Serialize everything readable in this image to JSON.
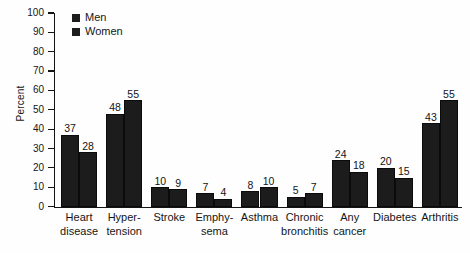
{
  "chart_data": {
    "type": "bar",
    "title": "",
    "xlabel": "",
    "ylabel": "Percent",
    "ylim": [
      0,
      100
    ],
    "ytick_step": 10,
    "yticks": [
      100,
      90,
      80,
      70,
      60,
      50,
      40,
      30,
      20,
      10,
      0
    ],
    "grid": false,
    "legend_position": "top-left",
    "categories": [
      "Heart disease",
      "Hypertension",
      "Stroke",
      "Emphysema",
      "Asthma",
      "Chronic bronchitis",
      "Any cancer",
      "Diabetes",
      "Arthritis"
    ],
    "category_label_lines": [
      [
        "Heart",
        "disease"
      ],
      [
        "Hyper-",
        "tension"
      ],
      [
        "Stroke",
        ""
      ],
      [
        "Emphy-",
        "sema"
      ],
      [
        "Asthma",
        ""
      ],
      [
        "Chronic",
        "bronchitis"
      ],
      [
        "Any",
        "cancer"
      ],
      [
        "Diabetes",
        ""
      ],
      [
        "Arthritis",
        ""
      ]
    ],
    "series": [
      {
        "name": "Men",
        "values": [
          37,
          48,
          10,
          7,
          8,
          5,
          24,
          20,
          43
        ]
      },
      {
        "name": "Women",
        "values": [
          28,
          55,
          9,
          4,
          10,
          7,
          18,
          15,
          55
        ]
      }
    ],
    "colors": {
      "men": "#1c1c1c",
      "women": "#1c1c1c",
      "axis": "#141414",
      "text": "#151515",
      "background": "#fefefe"
    }
  }
}
